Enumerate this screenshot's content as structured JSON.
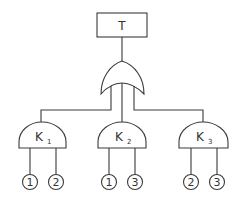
{
  "diagram": {
    "type": "fault-tree",
    "top_event": {
      "label": "T"
    },
    "top_gate": {
      "type": "OR"
    },
    "gates": [
      {
        "id": "K1",
        "base": "K",
        "sub": "1",
        "type": "AND",
        "inputs": [
          "1",
          "2"
        ]
      },
      {
        "id": "K2",
        "base": "K",
        "sub": "2",
        "type": "AND",
        "inputs": [
          "1",
          "3"
        ]
      },
      {
        "id": "K3",
        "base": "K",
        "sub": "3",
        "type": "AND",
        "inputs": [
          "2",
          "3"
        ]
      }
    ],
    "colors": {
      "stroke": "#3a3a3a",
      "background": "#ffffff",
      "text": "#333333"
    }
  }
}
